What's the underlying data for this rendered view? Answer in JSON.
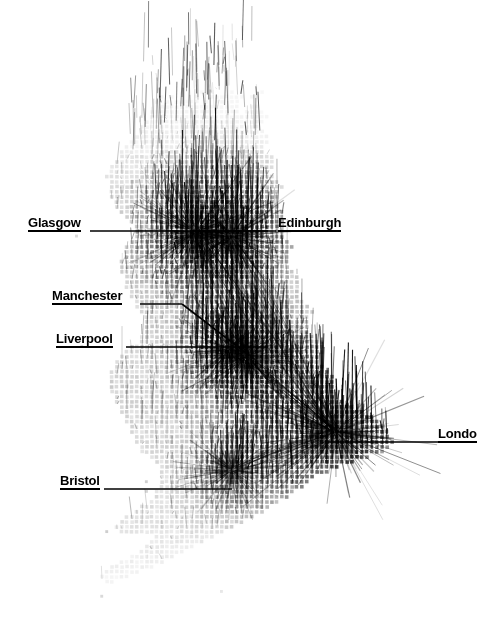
{
  "figure": {
    "title": "",
    "background_color": "#ffffff",
    "ink_color": "#000000",
    "width": 480,
    "height": 626
  },
  "labels": [
    {
      "name": "glasgow",
      "text": "Glasgow",
      "x": 28,
      "y": 216,
      "underline_to": 268,
      "leader": [
        [
          268,
          230
        ],
        [
          268,
          230
        ]
      ]
    },
    {
      "name": "edinburgh",
      "text": "Edinburgh",
      "x": 278,
      "y": 216,
      "underline_from": 258,
      "leader": [
        [
          258,
          230
        ],
        [
          190,
          230
        ]
      ]
    },
    {
      "name": "manchester",
      "text": "Manchester",
      "x": 52,
      "y": 289,
      "underline_to": 178,
      "leader": [
        [
          178,
          303
        ],
        [
          243,
          352
        ]
      ]
    },
    {
      "name": "liverpool",
      "text": "Liverpool",
      "x": 56,
      "y": 332,
      "underline_to": 200,
      "leader": [
        [
          200,
          346
        ],
        [
          268,
          346
        ]
      ]
    },
    {
      "name": "london",
      "text": "Londo",
      "x": 438,
      "y": 427,
      "underline_to": 480,
      "leader": [
        [
          438,
          441
        ],
        [
          330,
          441
        ]
      ]
    },
    {
      "name": "bristol",
      "text": "Bristol",
      "x": 60,
      "y": 474,
      "underline_to": 172,
      "leader": [
        [
          172,
          488
        ],
        [
          230,
          488
        ]
      ]
    }
  ],
  "chart_data": {
    "type": "scatter",
    "title": "",
    "subtitle": "",
    "xlabel": "",
    "ylabel": "",
    "legend": [],
    "grid": false,
    "grid_pitch": 5,
    "cell_size": 3.6,
    "xlim": [
      0,
      480
    ],
    "ylim": [
      0,
      626
    ],
    "cities": [
      {
        "name": "Glasgow",
        "x": 196,
        "y": 232,
        "intensity": 0.86,
        "radius": 26
      },
      {
        "name": "Edinburgh",
        "x": 232,
        "y": 236,
        "intensity": 0.8,
        "radius": 24
      },
      {
        "name": "Manchester",
        "x": 248,
        "y": 356,
        "intensity": 0.78,
        "radius": 22
      },
      {
        "name": "Liverpool",
        "x": 228,
        "y": 350,
        "intensity": 0.7,
        "radius": 18
      },
      {
        "name": "Bristol",
        "x": 232,
        "y": 470,
        "intensity": 0.62,
        "radius": 18
      },
      {
        "name": "London",
        "x": 336,
        "y": 432,
        "intensity": 1.0,
        "radius": 34
      }
    ],
    "arcs": [
      {
        "from": "Glasgow",
        "to": "London",
        "weight": 0.9
      },
      {
        "from": "Edinburgh",
        "to": "London",
        "weight": 0.9
      },
      {
        "from": "Glasgow",
        "to": "Manchester",
        "weight": 0.6
      },
      {
        "from": "Edinburgh",
        "to": "Manchester",
        "weight": 0.6
      },
      {
        "from": "Manchester",
        "to": "London",
        "weight": 0.8
      },
      {
        "from": "Liverpool",
        "to": "London",
        "weight": 0.7
      },
      {
        "from": "Glasgow",
        "to": "Edinburgh",
        "weight": 0.5
      },
      {
        "from": "Bristol",
        "to": "London",
        "weight": 0.5
      }
    ],
    "outline_regions": [
      {
        "name": "north-scotland",
        "x": 150,
        "y": 60,
        "density": 0.18
      },
      {
        "name": "central-belt",
        "x": 195,
        "y": 215,
        "density": 0.95
      },
      {
        "name": "northern-england",
        "x": 245,
        "y": 320,
        "density": 0.72
      },
      {
        "name": "midlands",
        "x": 275,
        "y": 400,
        "density": 0.62
      },
      {
        "name": "south-east",
        "x": 340,
        "y": 435,
        "density": 1.0
      },
      {
        "name": "south-west",
        "x": 150,
        "y": 540,
        "density": 0.3
      },
      {
        "name": "wales",
        "x": 175,
        "y": 440,
        "density": 0.42
      }
    ]
  }
}
